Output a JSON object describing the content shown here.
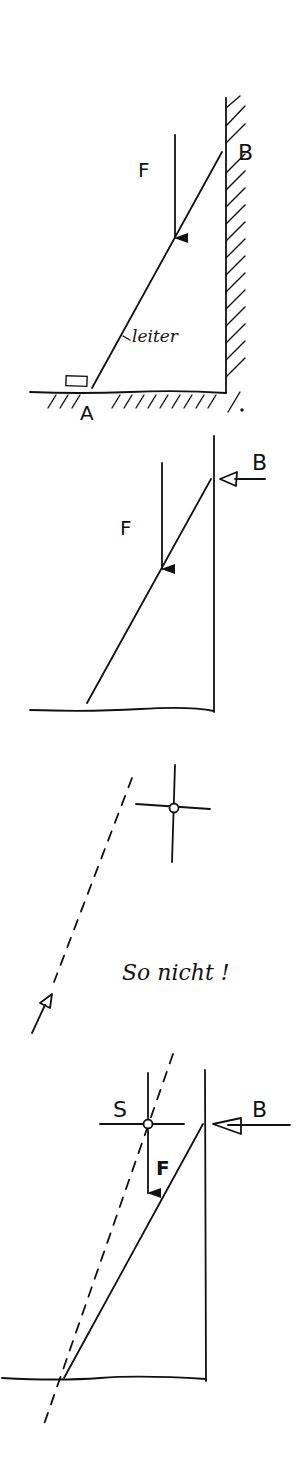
{
  "diagram": {
    "ink_color": "#111111",
    "background": "#ffffff",
    "panels": [
      {
        "id": "panel-1-setup",
        "labels": {
          "force": "F",
          "top_support": "B",
          "bottom_support": "A",
          "ladder": "leiter"
        },
        "elements": [
          "hatched wall (right)",
          "hatched ground",
          "ladder A-B",
          "block at A",
          "vertical load F"
        ]
      },
      {
        "id": "panel-2-free-body",
        "labels": {
          "force": "F",
          "top_reaction": "B"
        },
        "elements": [
          "wall line",
          "ground line",
          "ladder",
          "vertical load F",
          "horizontal reaction B (open arrow)"
        ]
      },
      {
        "id": "panel-3-wrong",
        "labels": {
          "note": "So nicht !"
        },
        "elements": [
          "dashed action line",
          "open arrow head",
          "crosshair with circle"
        ]
      },
      {
        "id": "panel-4-correct",
        "labels": {
          "intersection": "S",
          "force": "F",
          "top_reaction": "B"
        },
        "elements": [
          "wall line",
          "ground line",
          "ladder",
          "dashed line through S",
          "crosshair S",
          "load F",
          "reaction B"
        ]
      }
    ]
  }
}
